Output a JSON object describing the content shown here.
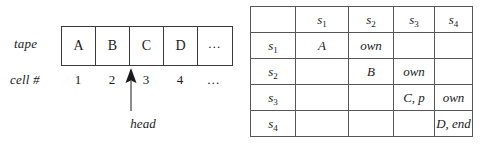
{
  "figure": {
    "tape": {
      "row_label": "tape",
      "cellnum_label": "cell #",
      "cells": [
        {
          "symbol": "A",
          "number": "1"
        },
        {
          "symbol": "B",
          "number": "2"
        },
        {
          "symbol": "C",
          "number": "3"
        },
        {
          "symbol": "D",
          "number": "4"
        },
        {
          "symbol": "…",
          "number": "…"
        }
      ],
      "head": {
        "label": "head",
        "points_to_cell_number": "3"
      }
    },
    "transition_table": {
      "corner_label": "",
      "column_headers": [
        {
          "base": "s",
          "sub": "1"
        },
        {
          "base": "s",
          "sub": "2"
        },
        {
          "base": "s",
          "sub": "3"
        },
        {
          "base": "s",
          "sub": "4"
        }
      ],
      "row_headers": [
        {
          "base": "s",
          "sub": "1"
        },
        {
          "base": "s",
          "sub": "2"
        },
        {
          "base": "s",
          "sub": "3"
        },
        {
          "base": "s",
          "sub": "4"
        }
      ],
      "rows": [
        {
          "cells": [
            "A",
            "own",
            "",
            ""
          ]
        },
        {
          "cells": [
            "",
            "B",
            "own",
            ""
          ]
        },
        {
          "cells": [
            "",
            "",
            "C, p",
            "own"
          ]
        },
        {
          "cells": [
            "",
            "",
            "",
            "D, end"
          ]
        }
      ]
    }
  },
  "colors": {
    "ink": "#1a1a1a",
    "rule": "#55555a",
    "tape_rule": "#3a3a3a",
    "background": "#ffffff"
  }
}
